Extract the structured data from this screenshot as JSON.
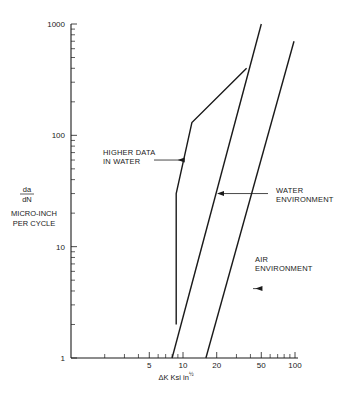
{
  "chart_data": {
    "type": "line",
    "title": "",
    "xscale": "log",
    "yscale": "log",
    "xlim": [
      1,
      100
    ],
    "ylim": [
      1,
      1000
    ],
    "xlabel": "ΔK  Ksi in½",
    "xlabel_main": "ΔK  Ksi in",
    "xlabel_sup": "½",
    "ylabel_fraction": {
      "numerator": "da",
      "denominator": "dN"
    },
    "ylabel_lines": [
      "MICRO-INCH",
      "PER CYCLE"
    ],
    "x_tick_labels": [
      {
        "value": 5,
        "label": "5"
      },
      {
        "value": 10,
        "label": "10"
      },
      {
        "value": 20,
        "label": "20"
      },
      {
        "value": 50,
        "label": "50"
      },
      {
        "value": 100,
        "label": "100"
      }
    ],
    "x_minor_ticks": [
      2,
      3,
      4,
      6,
      7,
      8,
      9,
      30,
      40,
      60,
      70,
      80,
      90
    ],
    "y_tick_labels": [
      {
        "value": 1,
        "label": "1"
      },
      {
        "value": 10,
        "label": "10"
      },
      {
        "value": 100,
        "label": "100"
      },
      {
        "value": 1000,
        "label": "1000"
      }
    ],
    "y_minor_ticks": [
      2,
      3,
      4,
      5,
      6,
      7,
      8,
      9,
      20,
      30,
      40,
      50,
      60,
      70,
      80,
      90,
      200,
      300,
      400,
      500,
      600,
      700,
      800,
      900
    ],
    "grid": false,
    "series": [
      {
        "name": "Higher data in water",
        "points": [
          [
            8.7,
            2
          ],
          [
            8.7,
            30
          ],
          [
            12,
            130
          ],
          [
            37,
            400
          ]
        ]
      },
      {
        "name": "Water environment",
        "points": [
          [
            8,
            1
          ],
          [
            50,
            1000
          ]
        ]
      },
      {
        "name": "Air environment",
        "points": [
          [
            16,
            1
          ],
          [
            98,
            700
          ]
        ]
      }
    ],
    "annotations": [
      {
        "lines": [
          "HIGHER DATA",
          "IN WATER"
        ],
        "arrow_to": [
          8.7,
          60
        ]
      },
      {
        "lines": [
          "WATER",
          "ENVIRONMENT"
        ],
        "arrow_to": [
          19.5,
          30
        ]
      },
      {
        "lines": [
          "AIR",
          "ENVIRONMENT"
        ],
        "arrow_to": [
          43,
          4.2
        ]
      }
    ]
  },
  "colors": {
    "ink": "#1a1a1a",
    "background": "#ffffff"
  }
}
